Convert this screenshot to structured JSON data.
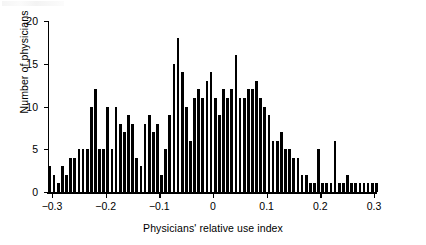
{
  "chart_data": {
    "type": "bar",
    "title": "",
    "xlabel": "Physicians' relative use index",
    "ylabel": "Number of physicians",
    "xlim": [
      -0.3075,
      0.3075
    ],
    "ylim": [
      0,
      20
    ],
    "grid": false,
    "legend": null,
    "bin_width": 0.0077,
    "xticks": [
      -0.3,
      -0.2,
      -0.1,
      0,
      0.1,
      0.2,
      0.3
    ],
    "xtick_labels": [
      "−0.3",
      "−0.2",
      "−0.1",
      "0",
      "0.1",
      "0.2",
      "0.3"
    ],
    "yticks": [
      0,
      5,
      10,
      15,
      20
    ],
    "ytick_labels": [
      "0",
      "5",
      "10",
      "15",
      "20"
    ],
    "bar_color": "#000000",
    "x": [
      -0.3038,
      -0.2961,
      -0.2884,
      -0.2807,
      -0.273,
      -0.2653,
      -0.2576,
      -0.2499,
      -0.2422,
      -0.2345,
      -0.2268,
      -0.2191,
      -0.2114,
      -0.2037,
      -0.196,
      -0.1883,
      -0.1806,
      -0.1729,
      -0.1652,
      -0.1575,
      -0.1498,
      -0.1421,
      -0.1344,
      -0.1267,
      -0.119,
      -0.1113,
      -0.1036,
      -0.0959,
      -0.0882,
      -0.0805,
      -0.0728,
      -0.0651,
      -0.0574,
      -0.0497,
      -0.042,
      -0.0343,
      -0.0266,
      -0.0189,
      -0.0112,
      -0.0035,
      0.0042,
      0.0119,
      0.0196,
      0.0273,
      0.035,
      0.0427,
      0.0504,
      0.0581,
      0.0658,
      0.0735,
      0.0812,
      0.0889,
      0.0966,
      0.1043,
      0.112,
      0.1197,
      0.1274,
      0.1351,
      0.1428,
      0.1505,
      0.1582,
      0.1659,
      0.1736,
      0.1813,
      0.189,
      0.1967,
      0.2044,
      0.2121,
      0.2198,
      0.2275,
      0.2352,
      0.2429,
      0.2506,
      0.2583,
      0.266,
      0.2737,
      0.2814,
      0.2891,
      0.2968,
      0.3045
    ],
    "values": [
      3,
      2,
      1,
      3,
      2,
      4,
      4,
      5,
      5,
      5,
      10,
      12,
      5,
      5,
      10,
      5,
      10,
      8,
      7,
      9,
      8,
      4,
      3,
      8,
      9,
      7,
      8,
      2,
      5,
      9,
      15,
      18,
      14,
      10,
      6,
      11,
      12,
      11,
      13,
      14,
      11,
      9,
      12,
      11,
      12,
      16,
      11,
      11,
      12,
      12,
      13,
      11,
      10,
      9,
      6,
      6,
      7,
      5,
      5,
      4,
      4,
      2,
      2,
      1,
      1,
      5,
      1,
      1,
      1,
      6,
      1,
      1,
      2,
      1,
      1,
      1,
      1,
      1,
      1,
      1
    ],
    "peak": {
      "value": 18,
      "x": -0.0651
    },
    "n_bins": 80
  }
}
